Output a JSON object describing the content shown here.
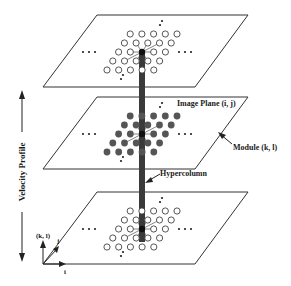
{
  "diagram": {
    "labels": {
      "image_plane": "Image Plane (i, j)",
      "module": "Module (k, l)",
      "hypercolumn": "Hypercolumn",
      "velocity_profile": "Velocity Profile",
      "axis_kl": "(k, l)",
      "axis_j": "j",
      "axis_i": "i"
    },
    "planes": [
      {
        "name": "top",
        "node_style": "hollow"
      },
      {
        "name": "middle",
        "node_style": "filled"
      },
      {
        "name": "bottom",
        "node_style": "hollow"
      }
    ],
    "colors": {
      "line": "#333333",
      "node_fill": "#555555",
      "hypercolumn": "#3a3a3a"
    }
  }
}
